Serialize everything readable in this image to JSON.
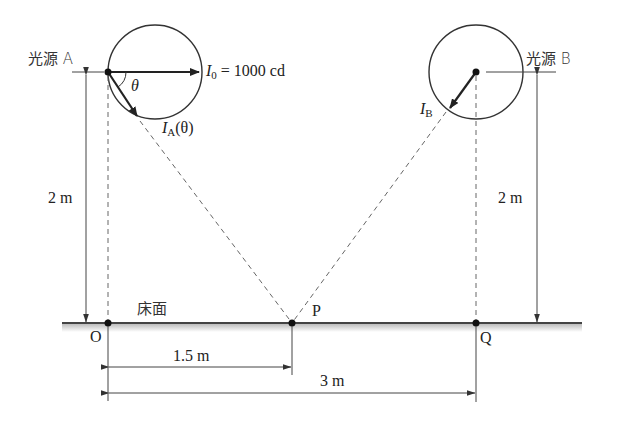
{
  "diagram": {
    "type": "illuminance-geometry",
    "light_sources": [
      {
        "id": "A",
        "label": "光源 A",
        "intensity_vector_label": "I",
        "intensity_vector_sub": "A",
        "intensity_vector_arg": "(θ)",
        "reference_intensity_label": "I",
        "reference_intensity_sub": "0",
        "reference_intensity_value": " = 1000 cd",
        "angle_label": "θ",
        "height_label": "2 m"
      },
      {
        "id": "B",
        "label": "光源 B",
        "intensity_vector_label": "I",
        "intensity_vector_sub": "B",
        "height_label": "2 m"
      }
    ],
    "floor": {
      "label": "床面",
      "points": [
        {
          "id": "O",
          "label": "O"
        },
        {
          "id": "P",
          "label": "P"
        },
        {
          "id": "Q",
          "label": "Q"
        }
      ]
    },
    "dimensions": [
      {
        "from": "O",
        "to": "P",
        "label": "1.5 m"
      },
      {
        "from": "O",
        "to": "Q",
        "label": "3 m"
      }
    ],
    "colors": {
      "line": "#333333",
      "dashed": "#666666",
      "floor_shadow": "#c8c8c8"
    }
  }
}
